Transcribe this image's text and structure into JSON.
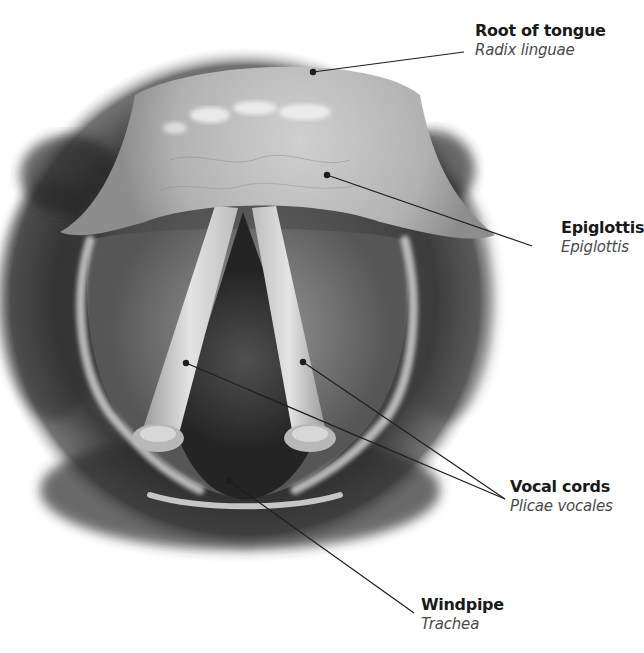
{
  "figure": {
    "colors": {
      "background": "#ffffff",
      "leader_line": "#1e1e1e",
      "text_primary": "#1a1a1a",
      "text_secondary": "#4a4a4a"
    }
  },
  "labels": [
    {
      "id": "root-of-tongue",
      "name": "Root of tongue",
      "latin": "Radix linguae"
    },
    {
      "id": "epiglottis",
      "name": "Epiglottis",
      "latin": "Epiglottis"
    },
    {
      "id": "vocal-cords",
      "name": "Vocal cords",
      "latin": "Plicae vocales"
    },
    {
      "id": "windpipe",
      "name": "Windpipe",
      "latin": "Trachea"
    }
  ]
}
